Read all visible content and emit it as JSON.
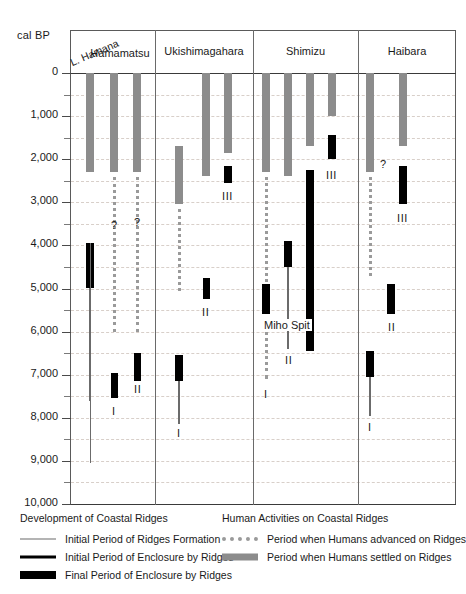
{
  "axis": {
    "unit_label": "cal BP",
    "tick_labels": [
      "0",
      "1,000",
      "2,000",
      "3,000",
      "4,000",
      "5,000",
      "6,000",
      "7,000",
      "8,000",
      "9,000",
      "10,000"
    ],
    "min": 0,
    "max": 10000,
    "major_step": 1000,
    "minor_step": 500,
    "direction": "inverted"
  },
  "columns": [
    {
      "id": "hamana-hamamatsu",
      "labels": [
        "L. Hamana",
        "Hamamatsu"
      ]
    },
    {
      "id": "ukishimagahara",
      "labels": [
        "Ukishimagahara"
      ]
    },
    {
      "id": "shimizu",
      "labels": [
        "Shimizu"
      ]
    },
    {
      "id": "haibara",
      "labels": [
        "Haibara"
      ]
    }
  ],
  "legend": {
    "left_title": "Development of Coastal Ridges",
    "right_title": "Human Activities on Coastal Ridges",
    "left_items": [
      {
        "key": "initial-formation",
        "label": "Initial Period of Ridges Formation",
        "style": "thin-line"
      },
      {
        "key": "initial-enclosure",
        "label": "Initial Period of Enclosure by Ridges",
        "style": "medium-line"
      },
      {
        "key": "final-enclosure",
        "label": "Final Period of Enclosure by Ridges",
        "style": "thick-bar"
      }
    ],
    "right_items": [
      {
        "key": "humans-advanced",
        "label": "Period when Humans advanced on Ridges",
        "style": "dotted-line"
      },
      {
        "key": "humans-settled",
        "label": "Period when Humans settled on Ridges",
        "style": "gray-bar"
      }
    ]
  },
  "annotations": {
    "miho_spit": "Miho Spit",
    "question_mark": "?",
    "roman_1": "I",
    "roman_2": "II",
    "roman_3": "III"
  },
  "colors": {
    "settled_gray": "#8c8c8c",
    "advanced_gray": "#9a9a9a",
    "enclosure_black": "#000000",
    "formation_gray": "#6b6b6b",
    "gridline": "#d8cfc9",
    "frame": "#5a5a5a"
  },
  "chart_data": {
    "type": "range-bar",
    "ylabel": "cal BP",
    "ylim": [
      0,
      10000
    ],
    "y_inverted": true,
    "grid": "horizontal-dashed",
    "legend_position": "below",
    "categories": [
      "L. Hamana",
      "Hamamatsu",
      "Ukishimagahara",
      "Shimizu",
      "Haibara"
    ],
    "series": [
      {
        "name": "Period when Humans settled on Ridges",
        "style": "gray-bar"
      },
      {
        "name": "Period when Humans advanced on Ridges",
        "style": "dotted-line"
      },
      {
        "name": "Initial Period of Ridges Formation",
        "style": "thin-line"
      },
      {
        "name": "Initial Period of Enclosure by Ridges",
        "style": "medium-line"
      },
      {
        "name": "Final Period of Enclosure by Ridges",
        "style": "thick-bar"
      }
    ],
    "sites": [
      {
        "site": "L. Hamana / Hamamatsu",
        "ridges": [
          {
            "ridge": "A",
            "settled": [
              0,
              2300
            ],
            "formation": [
              3950,
              7600
            ],
            "final_enclosure": [
              3950,
              5000
            ]
          },
          {
            "ridge": "B",
            "settled": [
              0,
              2300
            ],
            "advanced": [
              2400,
              6000
            ],
            "final_enclosure": [
              6950,
              7550
            ],
            "label": "I"
          },
          {
            "ridge": "C",
            "settled": [
              0,
              2300
            ],
            "advanced": [
              2400,
              6000
            ],
            "final_enclosure": [
              6500,
              7150
            ],
            "label": "II",
            "uncertain": true
          }
        ]
      },
      {
        "site": "Ukishimagahara",
        "ridges": [
          {
            "ridge": "A",
            "settled": [
              1700,
              3050
            ],
            "advanced": [
              3150,
              5050
            ],
            "label_lower": "II",
            "final_enclosure": [
              4750,
              5250
            ]
          },
          {
            "ridge": "B",
            "settled": [
              0,
              2400
            ],
            "formation": [
              6550,
              8150
            ],
            "final_enclosure": [
              6550,
              7150
            ],
            "label": "I"
          },
          {
            "ridge": "C",
            "settled": [
              0,
              1850
            ],
            "final_enclosure": [
              2150,
              2550
            ],
            "label": "III"
          }
        ]
      },
      {
        "site": "Shimizu",
        "ridges": [
          {
            "ridge": "A",
            "settled": [
              0,
              2300
            ],
            "advanced": [
              2400,
              4850
            ]
          },
          {
            "ridge": "B",
            "settled": [
              0,
              2400
            ],
            "formation": [
              3900,
              6400
            ],
            "final_enclosure": [
              3900,
              4450
            ],
            "label": "II"
          },
          {
            "ridge": "C",
            "settled": [
              0,
              1700
            ],
            "formation": [
              2250,
              6450
            ],
            "final_enclosure": [
              2250,
              6450
            ],
            "label": "Miho Spit"
          },
          {
            "ridge": "D",
            "settled": [
              0,
              1000
            ],
            "final_enclosure": [
              1450,
              2000
            ],
            "label": "III"
          }
        ]
      },
      {
        "site": "Haibara",
        "ridges": [
          {
            "ridge": "A",
            "settled": [
              0,
              2300
            ],
            "advanced": [
              2400,
              4700
            ],
            "uncertain": true
          },
          {
            "ridge": "B",
            "settled": [
              0,
              1700
            ],
            "final_enclosure": [
              2150,
              3050
            ],
            "label": "III"
          },
          {
            "ridge": "C",
            "final_enclosure": [
              4900,
              5600
            ],
            "label": "II"
          },
          {
            "ridge": "D",
            "formation": [
              6450,
              7950
            ],
            "final_enclosure": [
              6450,
              7100
            ],
            "label": "I"
          }
        ]
      }
    ]
  }
}
